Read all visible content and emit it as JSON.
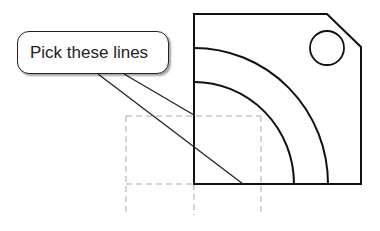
{
  "callout": {
    "text": "Pick these lines"
  },
  "colors": {
    "stroke": "#111111",
    "hidden_line": "#aaaaaa",
    "background": "#ffffff"
  }
}
